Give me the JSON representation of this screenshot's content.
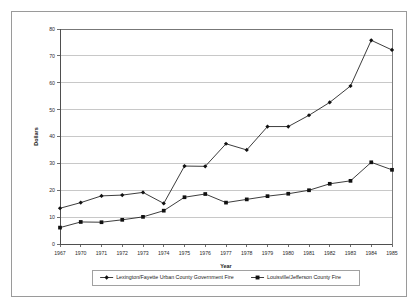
{
  "chart_data": {
    "type": "line",
    "title": "",
    "xlabel": "Year",
    "ylabel": "Dollars",
    "grid": true,
    "legend_position": "bottom",
    "xlim": [
      1967,
      1985
    ],
    "ylim": [
      0,
      80
    ],
    "ytick_labels": [
      "80",
      "70",
      "60",
      "50",
      "40",
      "30",
      "20",
      "10",
      "0"
    ],
    "yticks": [
      80,
      70,
      60,
      50,
      40,
      30,
      20,
      10,
      0
    ],
    "categories": [
      "1967",
      "1970",
      "1971",
      "1972",
      "1973",
      "1974",
      "1975",
      "1976",
      "1977",
      "1978",
      "1979",
      "1980",
      "1981",
      "1982",
      "1983",
      "1984",
      "1985"
    ],
    "series": [
      {
        "name": "Lexington/Fayette Urban County Government Fire",
        "marker": "diamond",
        "color": "#111111",
        "values": [
          13.3,
          15.4,
          17.9,
          18.2,
          19.2,
          15.1,
          29.0,
          28.9,
          37.3,
          35.0,
          43.7,
          43.7,
          47.9,
          52.7,
          58.8,
          75.8,
          72.2
        ]
      },
      {
        "name": "Louisville/Jefferson County Fire",
        "marker": "square",
        "color": "#111111",
        "values": [
          6.1,
          8.2,
          8.1,
          9.0,
          10.1,
          12.4,
          17.4,
          18.6,
          15.4,
          16.6,
          17.8,
          18.7,
          20.0,
          22.4,
          23.5,
          30.4,
          27.6
        ]
      }
    ]
  }
}
